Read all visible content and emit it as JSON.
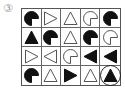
{
  "label": "③",
  "grid": {
    "rows": 4,
    "cols": 5,
    "cells": [
      [
        {
          "shape": "pacman",
          "fill": "black",
          "dir": "right"
        },
        {
          "shape": "triangle",
          "fill": "white",
          "dir": "right"
        },
        {
          "shape": "triangle",
          "fill": "white",
          "dir": "up"
        },
        {
          "shape": "pacman",
          "fill": "white",
          "dir": "right"
        },
        {
          "shape": "pacman",
          "fill": "black",
          "dir": "right"
        }
      ],
      [
        {
          "shape": "triangle",
          "fill": "black",
          "dir": "up"
        },
        {
          "shape": "pacman",
          "fill": "black",
          "dir": "right"
        },
        {
          "shape": "triangle",
          "fill": "white",
          "dir": "up"
        },
        {
          "shape": "pacman",
          "fill": "black",
          "dir": "right"
        },
        {
          "shape": "pacman",
          "fill": "white",
          "dir": "right"
        }
      ],
      [
        {
          "shape": "triangle",
          "fill": "white",
          "dir": "right"
        },
        {
          "shape": "triangle",
          "fill": "white",
          "dir": "left"
        },
        {
          "shape": "pacman",
          "fill": "white",
          "dir": "right"
        },
        {
          "shape": "triangle",
          "fill": "black",
          "dir": "left"
        },
        {
          "shape": "triangle",
          "fill": "black",
          "dir": "left"
        }
      ],
      [
        {
          "shape": "pacman",
          "fill": "black",
          "dir": "right"
        },
        {
          "shape": "triangle",
          "fill": "white",
          "dir": "up"
        },
        {
          "shape": "triangle",
          "fill": "black",
          "dir": "right"
        },
        {
          "shape": "triangle",
          "fill": "white",
          "dir": "up"
        },
        {
          "shape": "triangle",
          "fill": "black",
          "dir": "up",
          "circled": true
        }
      ]
    ]
  },
  "colors": {
    "shape_dark": "#111111",
    "outline": "#555555",
    "grid_line": "#666666",
    "label": "#9a9a9a"
  }
}
